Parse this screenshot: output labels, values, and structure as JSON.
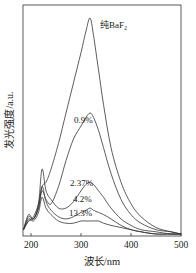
{
  "chart_data": {
    "type": "line",
    "title": "",
    "xlabel": "波长/nm",
    "ylabel": "发光强度/a.u.",
    "xlim": [
      185,
      500
    ],
    "ylim": [
      0,
      100
    ],
    "xticks": [
      200,
      300,
      400,
      500
    ],
    "yticks": [],
    "grid": false,
    "legend_position": "inline annotations",
    "series": [
      {
        "name": "纯BaF2",
        "label_display": "纯BaF₂",
        "x": [
          185,
          195,
          205,
          215,
          222,
          230,
          240,
          255,
          270,
          285,
          300,
          310,
          318,
          325,
          335,
          345,
          360,
          380,
          400,
          420,
          450,
          480,
          500
        ],
        "y": [
          2,
          6,
          8,
          14,
          22,
          24,
          30,
          42,
          56,
          70,
          84,
          94,
          100,
          92,
          76,
          60,
          40,
          24,
          14,
          8,
          3,
          1,
          0
        ]
      },
      {
        "name": "0.9%",
        "label_display": "0.9%",
        "x": [
          185,
          195,
          205,
          215,
          222,
          230,
          240,
          255,
          270,
          285,
          300,
          310,
          318,
          325,
          335,
          345,
          360,
          380,
          400,
          420,
          450,
          480,
          500
        ],
        "y": [
          2,
          6,
          7,
          12,
          20,
          16,
          14,
          22,
          34,
          44,
          50,
          54,
          56,
          54,
          48,
          40,
          28,
          16,
          9,
          5,
          2,
          1,
          0
        ]
      },
      {
        "name": "2.37%",
        "label_display": "2.37%",
        "x": [
          185,
          195,
          205,
          215,
          222,
          230,
          240,
          255,
          270,
          285,
          300,
          310,
          318,
          325,
          335,
          345,
          360,
          380,
          400,
          420,
          450,
          480,
          500
        ],
        "y": [
          2,
          9,
          7,
          14,
          30,
          20,
          16,
          12,
          12,
          15,
          20,
          23,
          24,
          23,
          20,
          17,
          12,
          7,
          4,
          2,
          1,
          0,
          0
        ]
      },
      {
        "name": "4.2%",
        "label_display": "4.2%",
        "x": [
          185,
          195,
          205,
          215,
          222,
          230,
          240,
          255,
          270,
          285,
          300,
          310,
          318,
          325,
          335,
          345,
          360,
          380,
          400,
          420,
          450,
          480,
          500
        ],
        "y": [
          2,
          8,
          7,
          12,
          22,
          15,
          11,
          8,
          7,
          8,
          10,
          11,
          12,
          11,
          10,
          9,
          7,
          4,
          2,
          1,
          0,
          0,
          0
        ]
      },
      {
        "name": "13.3%",
        "label_display": "13.3%",
        "x": [
          185,
          195,
          205,
          215,
          222,
          230,
          240,
          255,
          270,
          285,
          300,
          310,
          318,
          325,
          335,
          345,
          360,
          380,
          400,
          420,
          450,
          480,
          500
        ],
        "y": [
          2,
          7,
          6,
          10,
          17,
          12,
          9,
          6,
          5,
          5,
          6,
          6,
          6,
          6,
          6,
          5,
          4,
          3,
          2,
          1,
          0,
          0,
          0
        ]
      }
    ],
    "annotations": [
      {
        "text": "纯BaF₂",
        "near_x": 345,
        "near_y": 97
      },
      {
        "text": "0.9%",
        "near_x": 318,
        "near_y": 60
      },
      {
        "text": "2.37%",
        "near_x": 318,
        "near_y": 28
      },
      {
        "text": "4.2%",
        "near_x": 318,
        "near_y": 16
      },
      {
        "text": "13.3%",
        "near_x": 318,
        "near_y": 8
      }
    ]
  },
  "frame": {
    "left": 23,
    "right": 181,
    "top": 5,
    "bottom": 236
  },
  "colors": {
    "line": "#333333",
    "axis": "#333333",
    "text": "#222222",
    "background": "#ffffff"
  }
}
